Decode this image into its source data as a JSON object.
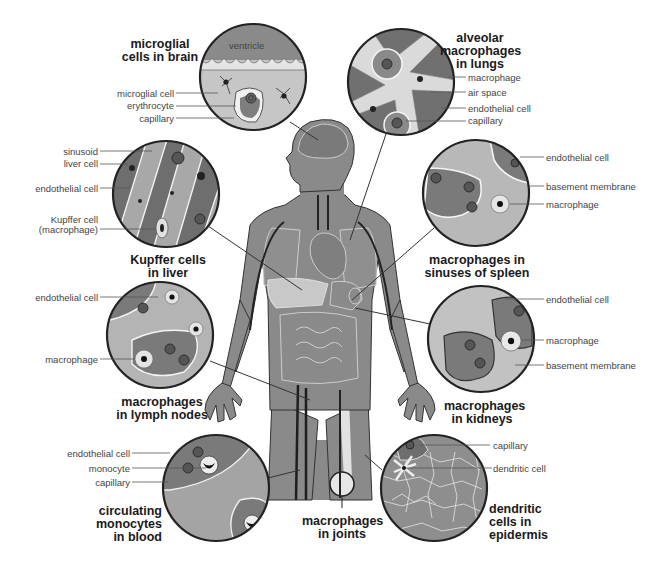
{
  "diagram": {
    "colors": {
      "background": "#ffffff",
      "body_fill": "#8a8a8a",
      "dark_tissue": "#6e6e6e",
      "mid_tissue": "#9c9c9c",
      "light_tissue": "#c4c4c4",
      "outline": "#2a2a2a",
      "text": "#444444",
      "title": "#1a1a1a"
    },
    "panels": [
      {
        "id": "brain",
        "title_lines": [
          "microglial",
          "cells in brain"
        ],
        "labels": [
          "ventricle",
          "microglial cell",
          "erythrocyte",
          "capillary"
        ]
      },
      {
        "id": "lungs",
        "title_lines": [
          "alveolar",
          "macrophages",
          "in lungs"
        ],
        "labels": [
          "macrophage",
          "air space",
          "endothelial cell",
          "capillary"
        ]
      },
      {
        "id": "liver",
        "title_lines": [
          "Kupffer cells",
          "in liver"
        ],
        "labels": [
          "sinusoid",
          "liver cell",
          "endothelial cell",
          "Kupffer cell",
          "(macrophage)"
        ]
      },
      {
        "id": "spleen",
        "title_lines": [
          "macrophages in",
          "sinuses of spleen"
        ],
        "labels": [
          "endothelial cell",
          "basement membrane",
          "macrophage"
        ]
      },
      {
        "id": "lymph",
        "title_lines": [
          "macrophages",
          "in lymph nodes"
        ],
        "labels": [
          "endothelial cell",
          "macrophage"
        ]
      },
      {
        "id": "kidneys",
        "title_lines": [
          "macrophages",
          "in kidneys"
        ],
        "labels": [
          "endothelial cell",
          "macrophage",
          "basement membrane"
        ]
      },
      {
        "id": "blood",
        "title_lines": [
          "circulating",
          "monocytes",
          "in blood"
        ],
        "labels": [
          "endothelial cell",
          "monocyte",
          "capillary"
        ]
      },
      {
        "id": "joints",
        "title_lines": [
          "macrophages",
          "in joints"
        ],
        "labels": []
      },
      {
        "id": "epidermis",
        "title_lines": [
          "dendritic",
          "cells in",
          "epidermis"
        ],
        "labels": [
          "capillary",
          "dendritic cell"
        ]
      }
    ]
  }
}
